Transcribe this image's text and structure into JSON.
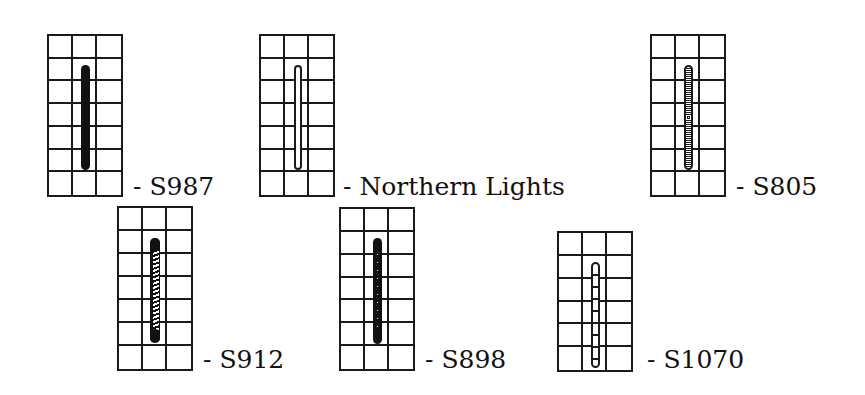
{
  "diagram": {
    "grid_columns": 3,
    "colors": {
      "line": "#1a1a1a",
      "fill": "#111111",
      "background": "#ffffff"
    },
    "swatches": [
      {
        "label": "- S987",
        "rows": 7,
        "stitch_style": "solid",
        "grid": {
          "x": 47,
          "y": 34,
          "w": 76,
          "h": 163
        },
        "stitch": {
          "x": 34,
          "y": 31,
          "w": 9,
          "h": 105
        },
        "label_pos": {
          "x": 133,
          "y": 174
        }
      },
      {
        "label": "- Northern Lights",
        "rows": 7,
        "stitch_style": "outline",
        "grid": {
          "x": 259,
          "y": 34,
          "w": 76,
          "h": 163
        },
        "stitch": {
          "x": 35,
          "y": 31,
          "w": 8,
          "h": 105
        },
        "label_pos": {
          "x": 343,
          "y": 174
        }
      },
      {
        "label": "- S805",
        "rows": 7,
        "stitch_style": "chain",
        "grid": {
          "x": 650,
          "y": 34,
          "w": 76,
          "h": 163
        },
        "stitch": {
          "x": 34,
          "y": 31,
          "w": 9,
          "h": 105
        },
        "label_pos": {
          "x": 736,
          "y": 174
        }
      },
      {
        "label": "- S912",
        "rows": 7,
        "stitch_style": "zigzag",
        "grid": {
          "x": 117,
          "y": 206,
          "w": 76,
          "h": 165
        },
        "stitch": {
          "x": 33,
          "y": 32,
          "w": 10,
          "h": 105
        },
        "label_pos": {
          "x": 203,
          "y": 347
        }
      },
      {
        "label": "- S898",
        "rows": 7,
        "stitch_style": "dotted",
        "grid": {
          "x": 339,
          "y": 207,
          "w": 76,
          "h": 164
        },
        "stitch": {
          "x": 34,
          "y": 31,
          "w": 9,
          "h": 106
        },
        "label_pos": {
          "x": 425,
          "y": 347
        }
      },
      {
        "label": "- S1070",
        "rows": 6,
        "stitch_style": "crossed",
        "grid": {
          "x": 557,
          "y": 231,
          "w": 76,
          "h": 141
        },
        "stitch": {
          "x": 34,
          "y": 31,
          "w": 9,
          "h": 106
        },
        "label_pos": {
          "x": 647,
          "y": 347
        }
      }
    ]
  }
}
